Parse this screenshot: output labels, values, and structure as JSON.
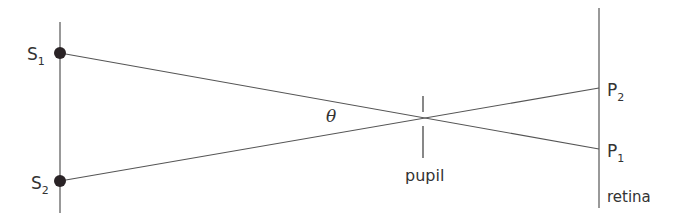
{
  "diagram": {
    "type": "optics-ray-diagram",
    "colors": {
      "line": "#555555",
      "dot": "#2a2326",
      "text": "#333333"
    },
    "sources": [
      {
        "letter": "S",
        "subscript": "1"
      },
      {
        "letter": "S",
        "subscript": "2"
      }
    ],
    "images": [
      {
        "letter": "P",
        "subscript": "2"
      },
      {
        "letter": "P",
        "subscript": "1"
      }
    ],
    "angle_label": "θ",
    "pupil_label": "pupil",
    "retina_label": "retina"
  }
}
